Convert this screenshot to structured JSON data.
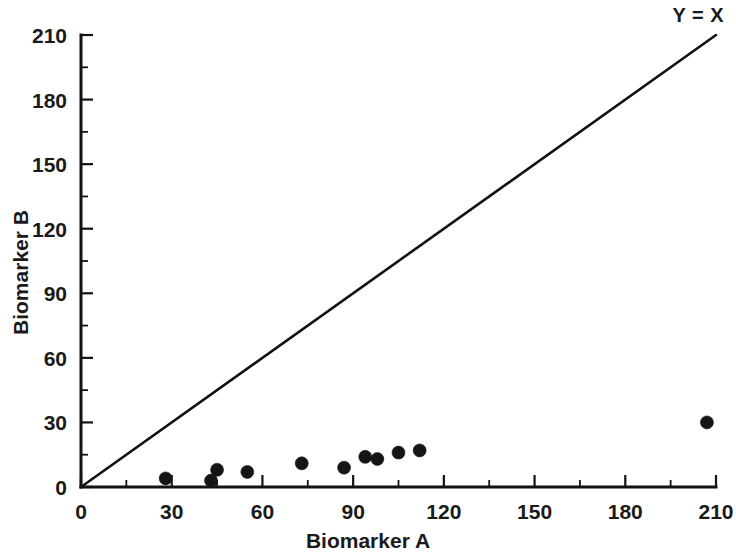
{
  "chart_data": {
    "type": "scatter",
    "title": "",
    "xlabel": "Biomarker A",
    "ylabel": "Biomarker B",
    "xlim": [
      0,
      210
    ],
    "ylim": [
      0,
      210
    ],
    "xticks": [
      0,
      30,
      60,
      90,
      120,
      150,
      180,
      210
    ],
    "yticks": [
      0,
      30,
      60,
      90,
      120,
      150,
      180,
      210
    ],
    "xtick_labels": [
      "0",
      "30",
      "60",
      "90",
      "120",
      "150",
      "180",
      "210"
    ],
    "ytick_labels": [
      "0",
      "30",
      "60",
      "90",
      "120",
      "150",
      "180",
      "210"
    ],
    "minor_tick_interval": 15,
    "grid": false,
    "legend": "none",
    "marker": "filled-circle",
    "marker_color": "#151515",
    "marker_size": 13,
    "annotations": [
      {
        "text": "Y = X",
        "position": "top-right",
        "describes": "identity-line"
      }
    ],
    "reference_line": {
      "name": "Y = X",
      "type": "identity",
      "slope": 1,
      "intercept": 0,
      "x_start": 0,
      "y_start": 0,
      "x_end": 210,
      "y_end": 210,
      "color": "#121212"
    },
    "series": [
      {
        "name": "Paired biomarker measurements",
        "points": [
          {
            "x": 28,
            "y": 4
          },
          {
            "x": 43,
            "y": 3
          },
          {
            "x": 45,
            "y": 8
          },
          {
            "x": 55,
            "y": 7
          },
          {
            "x": 73,
            "y": 11
          },
          {
            "x": 87,
            "y": 9
          },
          {
            "x": 94,
            "y": 14
          },
          {
            "x": 98,
            "y": 13
          },
          {
            "x": 105,
            "y": 16
          },
          {
            "x": 112,
            "y": 17
          },
          {
            "x": 207,
            "y": 30
          }
        ]
      }
    ]
  },
  "axes": {
    "x_title": "Biomarker A",
    "y_title": "Biomarker B"
  },
  "annotation": {
    "identity_label": "Y = X"
  },
  "colors": {
    "axis": "#121212",
    "marker": "#151515",
    "line": "#121212",
    "background": "#ffffff"
  }
}
